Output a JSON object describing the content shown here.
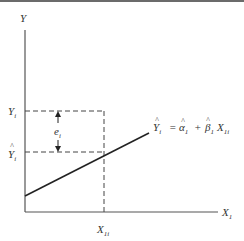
{
  "diagram": {
    "type": "regression-residual-plot",
    "axes": {
      "y_label": "Y",
      "x_label": "X",
      "x_label_sub": "1"
    },
    "points": {
      "y_observed_label": "Y",
      "y_observed_sub": "i",
      "y_fitted_label": "Y",
      "y_fitted_hat": "^",
      "y_fitted_sub": "i",
      "x_value_label": "X",
      "x_value_sub": "1i"
    },
    "residual": {
      "label": "e",
      "sub": "i"
    },
    "equation": {
      "lhs": "Y",
      "lhs_sub": "i",
      "equals": "=",
      "alpha": "α",
      "alpha_sub": "1",
      "plus": "+",
      "beta": "β",
      "beta_sub": "1",
      "x": "X",
      "x_sub": "1i",
      "hat": "^"
    },
    "colors": {
      "line": "#333333",
      "dashed": "#444444",
      "axis": "#555555",
      "top_bar": "#6b6b6b"
    }
  }
}
